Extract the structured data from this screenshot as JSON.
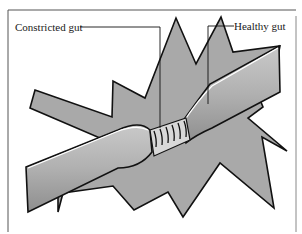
{
  "figure": {
    "labels": {
      "constricted": "Constricted gut",
      "healthy": "Healthy gut"
    },
    "colors": {
      "background": "#ffffff",
      "fill_gray": "#a9a9a9",
      "gut_fill": "#b3b3b3",
      "outline": "#111111",
      "frame": "#555555"
    }
  }
}
